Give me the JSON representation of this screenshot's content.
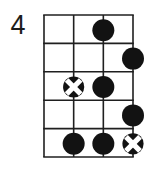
{
  "fret_label": "4",
  "colors": {
    "ink": "#1f1f1f",
    "dot": "#121212",
    "cross_stroke": "#ffffff",
    "background": "#ffffff"
  },
  "diagram": {
    "strings": 4,
    "frets": 5,
    "grid": {
      "x": 44,
      "y": 15,
      "width": 89,
      "height": 142
    },
    "line_width": 1.6,
    "dot_radius": 11,
    "cross_radius": 10.6,
    "markers": [
      {
        "type": "dot",
        "string": 3,
        "fret": 1
      },
      {
        "type": "dot",
        "string": 4,
        "fret": 2
      },
      {
        "type": "cross",
        "string": 2,
        "fret": 3
      },
      {
        "type": "dot",
        "string": 3,
        "fret": 3
      },
      {
        "type": "dot",
        "string": 4,
        "fret": 4
      },
      {
        "type": "dot",
        "string": 2,
        "fret": 5
      },
      {
        "type": "dot",
        "string": 3,
        "fret": 5
      },
      {
        "type": "cross",
        "string": 4,
        "fret": 5
      }
    ]
  }
}
